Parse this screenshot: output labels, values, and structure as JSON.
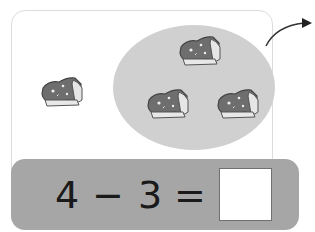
{
  "illustration": {
    "loose_items": [
      {
        "icon": "blanket-icon"
      }
    ],
    "grouped_items": [
      {
        "icon": "blanket-icon"
      },
      {
        "icon": "blanket-icon"
      },
      {
        "icon": "blanket-icon"
      }
    ],
    "group_highlight_color": "#d0d0d0",
    "arrow_icon": "curved-arrow-icon"
  },
  "equation": {
    "minuend": "4",
    "operator": "−",
    "subtrahend": "3",
    "equals": "=",
    "answer": "",
    "bar_color": "#a6a6a6"
  }
}
